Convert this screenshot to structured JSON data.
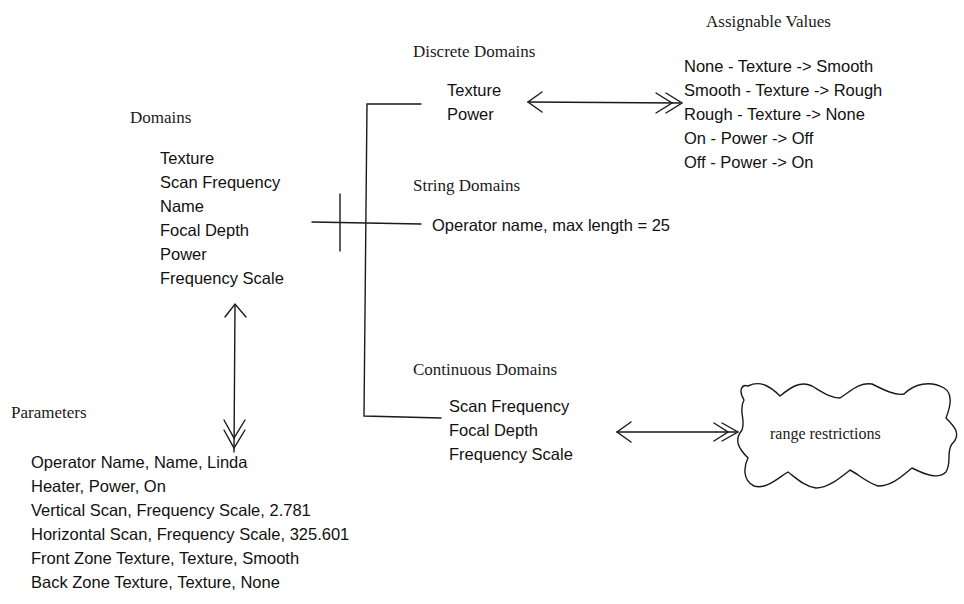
{
  "domains": {
    "title": "Domains",
    "items": [
      "Texture",
      "Scan Frequency",
      "Name",
      "Focal Depth",
      "Power",
      "Frequency Scale"
    ]
  },
  "discrete_domains": {
    "title": "Discrete Domains",
    "items": [
      "Texture",
      "Power"
    ]
  },
  "assignable_values": {
    "title": "Assignable Values",
    "items": [
      "None - Texture -> Smooth",
      "Smooth - Texture -> Rough",
      "Rough - Texture -> None",
      "On - Power -> Off",
      "Off - Power -> On"
    ]
  },
  "string_domains": {
    "title": "String Domains",
    "items": [
      "Operator name, max length = 25"
    ]
  },
  "continuous_domains": {
    "title": "Continuous Domains",
    "items": [
      "Scan Frequency",
      "Focal Depth",
      "Frequency Scale"
    ]
  },
  "range_restrictions": {
    "label": "range restrictions"
  },
  "parameters": {
    "title": "Parameters",
    "items": [
      "Operator Name, Name, Linda",
      "Heater, Power, On",
      "Vertical Scan, Frequency Scale, 2.781",
      "Horizontal Scan, Frequency Scale, 325.601",
      "Front Zone Texture, Texture, Smooth",
      "Back Zone Texture, Texture, None"
    ]
  },
  "colors": {
    "ink": "#1a1a1a",
    "background": "#ffffff"
  }
}
